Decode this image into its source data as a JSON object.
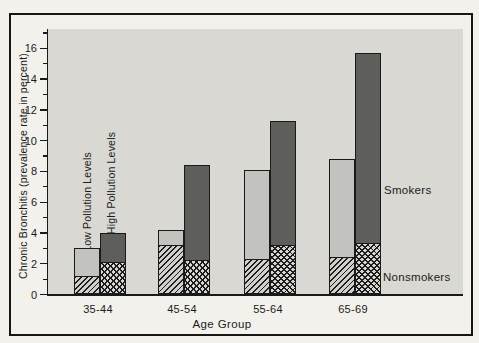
{
  "figure": {
    "margin_bg": "#f2f1ec",
    "frame_border_color": "#161616"
  },
  "chart_data": {
    "type": "bar",
    "variant": "paired-stacked-bars",
    "title": "",
    "xlabel": "Age Group",
    "ylabel": "Chronic Bronchitis (prevalence rate in percent)",
    "categories": [
      "35-44",
      "45-54",
      "55-64",
      "65-69"
    ],
    "ylim": [
      0,
      17.3
    ],
    "ytick_major": [
      0,
      2,
      4,
      6,
      8,
      10,
      12,
      14,
      16
    ],
    "ytick_minor": [
      1,
      3,
      5,
      7,
      9,
      11,
      13,
      15,
      17
    ],
    "grid": false,
    "legend_position": "labels-in-plot",
    "series": [
      {
        "name": "Low Pollution Levels",
        "pollution": "low",
        "nonsmokers_rate": [
          1.1,
          3.1,
          2.2,
          2.3
        ],
        "smokers_rate": [
          3.0,
          4.2,
          8.1,
          8.8
        ]
      },
      {
        "name": "High Pollution Levels",
        "pollution": "high",
        "nonsmokers_rate": [
          2.0,
          2.1,
          3.1,
          3.2
        ],
        "smokers_rate": [
          4.0,
          8.4,
          11.3,
          15.7
        ]
      }
    ],
    "annotations": {
      "smokers": "Smokers",
      "nonsmokers": "Nonsmokers",
      "low_series_label": "Low Pollution Levels",
      "high_series_label": "High Pollution Levels"
    },
    "colors": {
      "plot_bg": "#d9d8d3",
      "low_smokers_fill": "#c2c3be",
      "high_smokers_fill": "#5e5f5b",
      "low_nonsmokers_bg": "#d0cfca",
      "high_nonsmokers_bg": "#d6d5d0",
      "hatch_line": "#1d1d1d",
      "bar_border": "#1a1a1a",
      "axis": "#1a1a1a",
      "text": "#1b1b1b"
    }
  }
}
